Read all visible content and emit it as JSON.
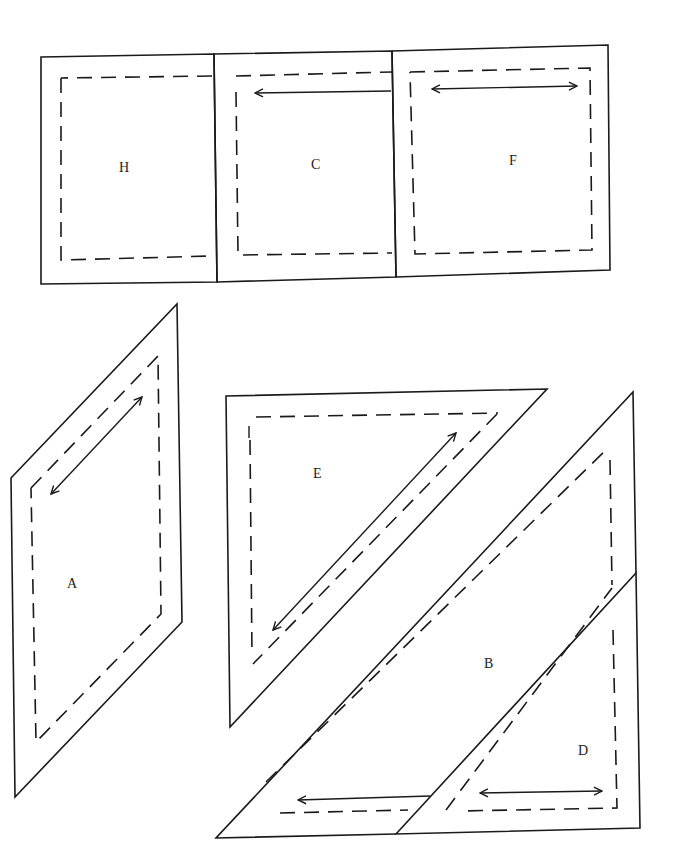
{
  "diagram": {
    "colors": {
      "background": "#ffffff",
      "ink": "#1a1a1a"
    },
    "pieces": [
      {
        "id": "H",
        "label": "H",
        "cut": "41,57 214,54 217,282 41,284",
        "sew": "61,78 61,260 212,256 213,76 61,78",
        "label_pos": [
          119,
          172
        ]
      },
      {
        "id": "C",
        "label": "C",
        "cut": "214,54 392,51 396,277 217,282",
        "sew": "236,91 238,255 392,253 M 210,76 L 392,72",
        "label_pos": [
          311,
          169
        ],
        "grain": {
          "x1": 391,
          "y1": 91,
          "x2": 255,
          "y2": 93,
          "heads": "start-only"
        }
      },
      {
        "id": "F",
        "label": "F",
        "cut": "392,51 608,45 610,270 396,277",
        "sew": "410,72 590,68 592,250 415,254 410,72",
        "label_pos": [
          509,
          165
        ],
        "grain": {
          "x1": 430,
          "y1": 89,
          "x2": 578,
          "y2": 86,
          "heads": "both"
        }
      },
      {
        "id": "A",
        "label": "A",
        "cut": "11,478 177,304 182,622 15,797",
        "sew": "31,488 158,354 161,613 36,741 31,488",
        "label_pos": [
          67,
          588
        ],
        "grain": {
          "x1": 143,
          "y1": 397,
          "x2": 50,
          "y2": 495,
          "heads": "both"
        }
      },
      {
        "id": "E",
        "label": "E",
        "cut": "226,396 547,389 230,727",
        "sew": "248,417 498,413 M 497,413 L 253,663 M 250,430 L 253,655",
        "label_pos": [
          313,
          478
        ],
        "grain": {
          "x1": 457,
          "y1": 432,
          "x2": 272,
          "y2": 630,
          "heads": "both"
        },
        "marker": {
          "x1": 249,
          "y1": 432,
          "x2": 249,
          "y2": 425
        }
      },
      {
        "id": "B",
        "label": "B",
        "cut": "216,838 633,392 636,573 396,834",
        "sew": "266,780 609,448 612,583 M 270,812 L 433,808",
        "label_pos": [
          484,
          668
        ],
        "grain": {
          "x1": 430,
          "y1": 795,
          "x2": 298,
          "y2": 799,
          "heads": "start-end-left"
        }
      },
      {
        "id": "D",
        "label": "D",
        "cut": "396,834 636,573 640,828",
        "sew": "445,811 612,588 M 612,588 L 617,808 L 445,811",
        "label_pos": [
          578,
          755
        ],
        "grain": {
          "x1": 478,
          "y1": 793,
          "x2": 602,
          "y2": 791,
          "heads": "both"
        }
      }
    ]
  }
}
